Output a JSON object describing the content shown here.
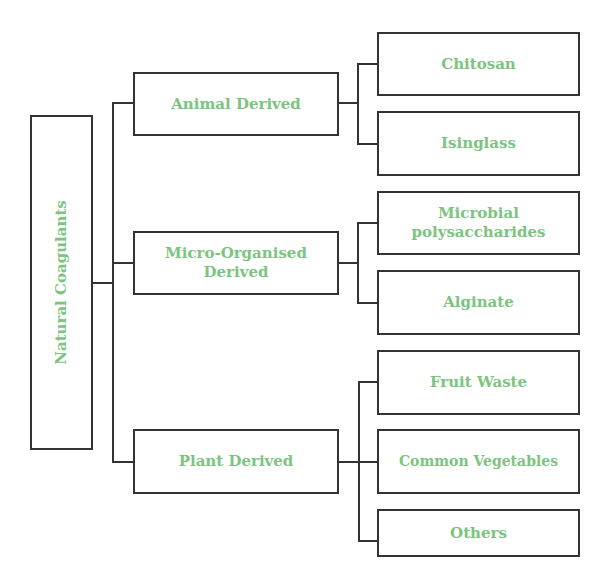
{
  "diagram": {
    "type": "tree",
    "root": {
      "label": "Natural Coagulants"
    },
    "categories": [
      {
        "label": "Animal Derived",
        "children": [
          {
            "label": "Chitosan"
          },
          {
            "label": "Isinglass"
          }
        ]
      },
      {
        "label": "Micro-Organised Derived",
        "children": [
          {
            "label": "Microbial polysaccharides"
          },
          {
            "label": "Alginate"
          }
        ]
      },
      {
        "label": "Plant Derived",
        "children": [
          {
            "label": "Fruit Waste"
          },
          {
            "label": "Common Vegetables"
          },
          {
            "label": "Others"
          }
        ]
      }
    ],
    "colors": {
      "text": "#7cc47f",
      "border": "#333333"
    }
  }
}
